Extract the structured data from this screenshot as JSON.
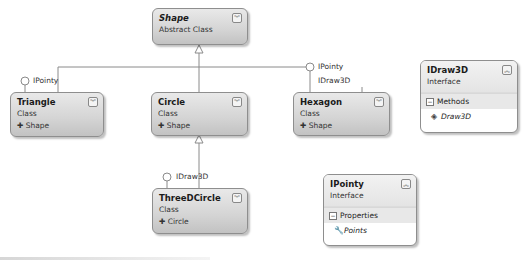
{
  "diagram": {
    "shape": {
      "name": "Shape",
      "kind": "Abstract Class"
    },
    "triangle": {
      "name": "Triangle",
      "kind": "Class",
      "base": "✚ Shape"
    },
    "circle": {
      "name": "Circle",
      "kind": "Class",
      "base": "✚ Shape"
    },
    "hexagon": {
      "name": "Hexagon",
      "kind": "Class",
      "base": "✚ Shape"
    },
    "threedcircle": {
      "name": "ThreeDCircle",
      "kind": "Class",
      "base": "✚ Circle"
    },
    "idraw3d": {
      "name": "IDraw3D",
      "kind": "Interface",
      "section": "Methods",
      "members": [
        "Draw3D"
      ]
    },
    "ipointy": {
      "name": "IPointy",
      "kind": "Interface",
      "section": "Properties",
      "members": [
        "Points"
      ]
    },
    "lollipops": {
      "triangle": "IPointy",
      "hexagon_1": "IPointy",
      "hexagon_2": "IDraw3D",
      "threedcircle": "IDraw3D"
    },
    "icons": {
      "collapse": "double-chevron-down",
      "expand": "double-chevron-up",
      "section_toggle": "minus-box",
      "method": "method-cube",
      "property": "property-wrench"
    }
  },
  "colors": {
    "box_border": "#8e8e8e",
    "box_fill": "#d4d4d4",
    "line": "#8a8a8a"
  }
}
